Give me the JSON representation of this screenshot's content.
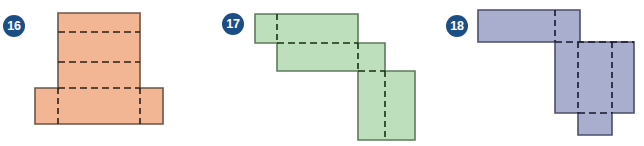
{
  "page": {
    "width": 644,
    "height": 146,
    "background": "#ffffff"
  },
  "figures": [
    {
      "number": "16",
      "badge": {
        "label": "16",
        "fill": "#1C4E86",
        "text_color": "#ffffff",
        "cx": 14,
        "cy": 26,
        "r": 11
      },
      "shape": {
        "name": "t-shaped-net",
        "fill": "#F2B695",
        "stroke": "#6B5547",
        "fold_color": "#2B2118",
        "outline": "M 58 13 L 140 13 L 140 88 L 163 88 L 163 124 L 35 124 L 35 88 L 58 88 Z",
        "folds": [
          {
            "name": "fold-horizontal-upper",
            "d": "M 58 32 L 140 32"
          },
          {
            "name": "fold-horizontal-lower",
            "d": "M 58 62 L 140 62"
          },
          {
            "name": "fold-horizontal-base",
            "d": "M 58 88 L 140 88"
          },
          {
            "name": "fold-vertical-left",
            "d": "M 58 88 L 58 124"
          },
          {
            "name": "fold-vertical-right",
            "d": "M 140 88 L 140 124"
          }
        ]
      }
    },
    {
      "number": "17",
      "badge": {
        "label": "17",
        "fill": "#1C4E86",
        "text_color": "#ffffff",
        "cx": 233,
        "cy": 24,
        "r": 11
      },
      "shape": {
        "name": "staircase-net",
        "fill": "#BEDFBB",
        "stroke": "#5E7B5C",
        "fold_color": "#16300F",
        "outline": "M 255 14 L 358 14 L 358 43 L 385 43 L 385 71 L 415 71 L 415 140 L 358 140 L 358 71 L 277 71 L 277 43 L 255 43 Z",
        "folds": [
          {
            "name": "fold-vertical-top-bar",
            "d": "M 277 14 L 277 43"
          },
          {
            "name": "fold-horizontal-step-one",
            "d": "M 277 43 L 358 43"
          },
          {
            "name": "fold-vertical-mid",
            "d": "M 358 43 L 358 71"
          },
          {
            "name": "fold-horizontal-step-two",
            "d": "M 358 71 L 385 71"
          },
          {
            "name": "fold-vertical-bottom",
            "d": "M 385 71 L 385 140"
          }
        ]
      }
    },
    {
      "number": "18",
      "badge": {
        "label": "18",
        "fill": "#1C4E86",
        "text_color": "#ffffff",
        "cx": 457,
        "cy": 26,
        "r": 11
      },
      "shape": {
        "name": "l-shaped-net-with-tab",
        "fill": "#A9AECE",
        "stroke": "#4B4F6B",
        "fold_color": "#15172B",
        "outline": "M 478 10 L 580 10 L 580 42 L 634 42 L 634 113 L 612 113 L 612 135 L 578 135 L 578 113 L 555 113 L 555 42 L 478 42 Z",
        "folds": [
          {
            "name": "fold-vertical-top-bar",
            "d": "M 555 10 L 555 42"
          },
          {
            "name": "fold-horizontal-shoulder",
            "d": "M 555 42 L 634 42"
          },
          {
            "name": "fold-vertical-body-left",
            "d": "M 578 42 L 578 113"
          },
          {
            "name": "fold-vertical-body-right",
            "d": "M 612 42 L 612 113"
          },
          {
            "name": "fold-horizontal-tab",
            "d": "M 578 113 L 612 113"
          }
        ]
      }
    }
  ]
}
